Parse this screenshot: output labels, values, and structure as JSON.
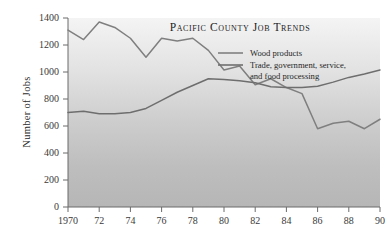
{
  "chart_data": {
    "type": "line",
    "title": "Pacific County Job Trends",
    "xlabel": "",
    "ylabel": "Number of Jobs",
    "xlim": [
      1970,
      1990
    ],
    "ylim": [
      0,
      1400
    ],
    "grid": false,
    "legend_position": "top-right",
    "x": [
      1970,
      1971,
      1972,
      1973,
      1974,
      1975,
      1976,
      1977,
      1978,
      1979,
      1980,
      1981,
      1982,
      1983,
      1984,
      1985,
      1986,
      1987,
      1988,
      1989,
      1990
    ],
    "xtick_labels": [
      "1970",
      "72",
      "74",
      "76",
      "78",
      "80",
      "82",
      "84",
      "86",
      "88",
      "90"
    ],
    "xtick_values": [
      1970,
      1972,
      1974,
      1976,
      1978,
      1980,
      1982,
      1984,
      1986,
      1988,
      1990
    ],
    "ytick_labels": [
      "0",
      "200",
      "400",
      "600",
      "800",
      "1000",
      "1200",
      "1400"
    ],
    "ytick_values": [
      0,
      200,
      400,
      600,
      800,
      1000,
      1200,
      1400
    ],
    "series": [
      {
        "name": "Wood products",
        "color": "#7f7f7f",
        "values": [
          1310,
          1240,
          1370,
          1330,
          1250,
          1110,
          1250,
          1230,
          1250,
          1160,
          1015,
          1045,
          905,
          950,
          885,
          840,
          580,
          620,
          635,
          580,
          650
        ]
      },
      {
        "name": "Trade, government, service, and food processing",
        "color": "#6e6e6e",
        "values": [
          700,
          710,
          690,
          690,
          700,
          730,
          790,
          850,
          900,
          950,
          945,
          935,
          920,
          890,
          885,
          885,
          895,
          925,
          960,
          985,
          1015
        ]
      }
    ]
  },
  "legend": {
    "items": [
      {
        "label": "Wood products"
      },
      {
        "label": "Trade, government, service,"
      },
      {
        "label": "and food processing"
      }
    ]
  },
  "style": {
    "plot_bg_top": "#f2f2f2",
    "plot_bg_bottom": "#b9b9b9",
    "axis_color": "#6b6b6b",
    "text_color": "#2b2b2b",
    "series1_color": "#7f7f7f",
    "series2_color": "#6e6e6e"
  }
}
